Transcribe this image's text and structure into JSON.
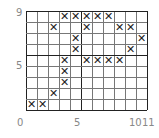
{
  "grid": {
    "cols": 11,
    "rows": 9,
    "thick_col": 5,
    "thick_row": 5
  },
  "marks": [
    [
      4,
      9
    ],
    [
      5,
      9
    ],
    [
      6,
      9
    ],
    [
      7,
      9
    ],
    [
      8,
      9
    ],
    [
      3,
      8
    ],
    [
      6,
      8
    ],
    [
      9,
      8
    ],
    [
      10,
      8
    ],
    [
      5,
      7
    ],
    [
      11,
      7
    ],
    [
      5,
      6
    ],
    [
      10,
      6
    ],
    [
      4,
      5
    ],
    [
      6,
      5
    ],
    [
      7,
      5
    ],
    [
      8,
      5
    ],
    [
      9,
      5
    ],
    [
      4,
      4
    ],
    [
      4,
      3
    ],
    [
      3,
      2
    ],
    [
      1,
      1
    ],
    [
      2,
      1
    ]
  ],
  "mark_glyph": "✕",
  "labels": {
    "y_top": "9",
    "y_mid": "5",
    "x_origin": "0",
    "x_mid": "5",
    "x_10": "10",
    "x_11": "11"
  }
}
